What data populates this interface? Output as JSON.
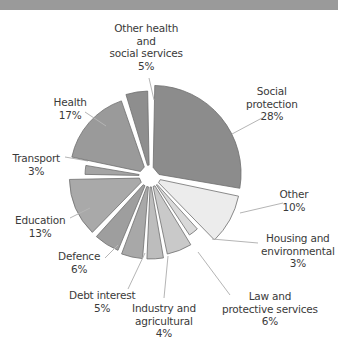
{
  "chart_data": {
    "type": "pie",
    "title": "",
    "start_angle_deg": 0,
    "direction": "clockwise",
    "center": [
      150,
      176
    ],
    "slices": [
      {
        "label": "Social protection",
        "value": 28,
        "color": "#8c8c8c",
        "radius": 88,
        "offset": 4,
        "text": "Social\nprotection\n28%",
        "lx": 272,
        "ly": 85,
        "leader": [
          [
            262,
            118
          ],
          [
            232,
            134
          ]
        ]
      },
      {
        "label": "Other",
        "value": 10,
        "color": "#ececec",
        "radius": 86,
        "offset": 5,
        "text": "Other\n10%",
        "lx": 294,
        "ly": 188,
        "leader": [
          [
            283,
            203
          ],
          [
            240,
            213
          ]
        ]
      },
      {
        "label": "Housing and environmental",
        "value": 3,
        "color": "#d9d9d9",
        "radius": 66,
        "offset": 5,
        "text": "Housing and\nenvironmental\n3%",
        "lx": 298,
        "ly": 232,
        "leader": [
          [
            258,
            243
          ],
          [
            212,
            239
          ]
        ]
      },
      {
        "label": "Law and protective services",
        "value": 6,
        "color": "#c9c9c9",
        "radius": 75,
        "offset": 5,
        "text": "Law and\nprotective services\n6%",
        "lx": 270,
        "ly": 290,
        "leader": [
          [
            230,
            295
          ],
          [
            198,
            252
          ]
        ]
      },
      {
        "label": "Industry and agricultural",
        "value": 4,
        "color": "#bdbdbd",
        "radius": 78,
        "offset": 5,
        "text": "Industry and\nagricultural\n4%",
        "lx": 164,
        "ly": 302,
        "leader": [
          [
            164,
            298
          ],
          [
            168,
            256
          ]
        ]
      },
      {
        "label": "Debt interest",
        "value": 5,
        "color": "#a8a8a8",
        "radius": 78,
        "offset": 5,
        "text": "Debt interest\n5%",
        "lx": 102,
        "ly": 289,
        "leader": [
          [
            128,
            289
          ],
          [
            145,
            253
          ]
        ]
      },
      {
        "label": "Defence",
        "value": 6,
        "color": "#9e9e9e",
        "radius": 76,
        "offset": 5,
        "text": "Defence\n6%",
        "lx": 79,
        "ly": 250,
        "leader": [
          [
            105,
            258
          ],
          [
            118,
            245
          ]
        ]
      },
      {
        "label": "Education",
        "value": 13,
        "color": "#a9a9a9",
        "radius": 76,
        "offset": 5,
        "text": "Education\n13%",
        "lx": 40,
        "ly": 214,
        "leader": [
          [
            70,
            218
          ],
          [
            90,
            208
          ]
        ]
      },
      {
        "label": "Transport",
        "value": 3,
        "color": "#a4a4a4",
        "radius": 60,
        "offset": 5,
        "text": "Transport\n3%",
        "lx": 36,
        "ly": 152,
        "leader": [
          [
            65,
            157
          ],
          [
            88,
            161
          ]
        ]
      },
      {
        "label": "Health",
        "value": 17,
        "color": "#9a9a9a",
        "radius": 76,
        "offset": 5,
        "text": "Health\n17%",
        "lx": 70,
        "ly": 96,
        "leader": [
          [
            85,
            112
          ],
          [
            106,
            126
          ]
        ]
      },
      {
        "label": "Other health and social services",
        "value": 5,
        "color": "#8e8e8e",
        "radius": 80,
        "offset": 5,
        "text": "Other health\nand\nsocial services\n5%",
        "lx": 146,
        "ly": 22,
        "leader": [
          [
            149,
            78
          ],
          [
            154,
            100
          ]
        ]
      }
    ],
    "legend": "none (direct labels)",
    "xlabel": "",
    "ylabel": ""
  }
}
